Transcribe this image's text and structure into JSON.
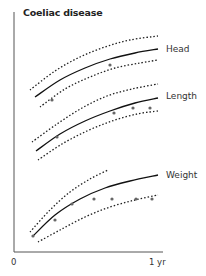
{
  "chart_data": {
    "type": "line",
    "title": "Coeliac disease",
    "xlabel": "",
    "ylabel": "",
    "x_ticks": [
      "0",
      "1 yr"
    ],
    "xlim": [
      0,
      1
    ],
    "grid": false,
    "legend": "none; series labeled at right end of curves",
    "series": [
      {
        "name": "Head",
        "label_pos": [
          166,
          49
        ],
        "reference_mean": [
          [
            35,
            97
          ],
          [
            60,
            80
          ],
          [
            85,
            68
          ],
          [
            110,
            59
          ],
          [
            135,
            53
          ],
          [
            158,
            49
          ]
        ],
        "upper_centile": [
          [
            30,
            90
          ],
          [
            55,
            71
          ],
          [
            80,
            57
          ],
          [
            105,
            47
          ],
          [
            130,
            40
          ],
          [
            158,
            36
          ]
        ],
        "lower_centile": [
          [
            40,
            107
          ],
          [
            65,
            89
          ],
          [
            90,
            77
          ],
          [
            115,
            68
          ],
          [
            140,
            63
          ],
          [
            158,
            60
          ]
        ],
        "patient_points": [
          [
            52,
            100
          ],
          [
            110,
            65
          ]
        ]
      },
      {
        "name": "Length",
        "label_pos": [
          166,
          97
        ],
        "reference_mean": [
          [
            36,
            151
          ],
          [
            60,
            134
          ],
          [
            85,
            121
          ],
          [
            110,
            111
          ],
          [
            135,
            103
          ],
          [
            158,
            98
          ]
        ],
        "upper_centile": [
          [
            32,
            142
          ],
          [
            57,
            124
          ],
          [
            82,
            108
          ],
          [
            107,
            96
          ],
          [
            132,
            89
          ],
          [
            158,
            84
          ]
        ],
        "lower_centile": [
          [
            38,
            160
          ],
          [
            62,
            144
          ],
          [
            87,
            131
          ],
          [
            112,
            121
          ],
          [
            137,
            114
          ],
          [
            158,
            111
          ]
        ],
        "patient_points": [
          [
            57,
            137
          ],
          [
            114,
            113
          ],
          [
            133,
            108
          ],
          [
            150,
            108
          ]
        ]
      },
      {
        "name": "Weight",
        "label_pos": [
          166,
          175
        ],
        "reference_mean": [
          [
            33,
            236
          ],
          [
            55,
            215
          ],
          [
            80,
            199
          ],
          [
            105,
            188
          ],
          [
            130,
            181
          ],
          [
            158,
            175
          ]
        ],
        "upper_centile": [
          [
            30,
            232
          ],
          [
            50,
            210
          ],
          [
            70,
            192
          ],
          [
            90,
            179
          ],
          [
            108,
            170
          ]
        ],
        "lower_centile": [
          [
            38,
            242
          ],
          [
            60,
            230
          ],
          [
            85,
            217
          ],
          [
            110,
            207
          ],
          [
            135,
            200
          ],
          [
            158,
            195
          ]
        ],
        "patient_points": [
          [
            33,
            236
          ],
          [
            55,
            220
          ],
          [
            72,
            204
          ],
          [
            94,
            199
          ],
          [
            112,
            199
          ],
          [
            136,
            199
          ],
          [
            152,
            199
          ]
        ]
      }
    ],
    "colors": {
      "mean": "#111111",
      "centile": "#222222",
      "points": "#666666",
      "axis": "#555555"
    }
  }
}
